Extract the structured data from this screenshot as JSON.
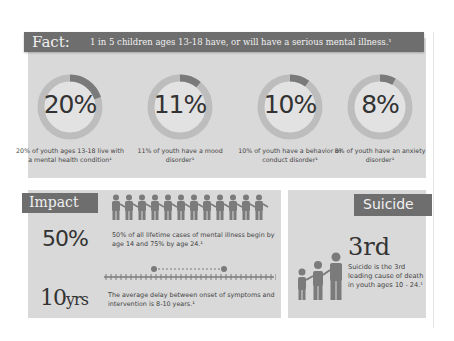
{
  "fact": {
    "label": "Fact:",
    "headline": "1 in 5 children ages 13-18 have, or will have a serious mental illness.¹",
    "stats": [
      {
        "value": 20,
        "label": "20%",
        "caption": "20% of youth ages 13-18 live with a mental health condition¹"
      },
      {
        "value": 11,
        "label": "11%",
        "caption": "11% of youth have a mood disorder¹"
      },
      {
        "value": 10,
        "label": "10%",
        "caption": "10% of youth have a behavior or conduct disorder¹"
      },
      {
        "value": 8,
        "label": "8%",
        "caption": "8% of youth have an anxiety disorder¹"
      }
    ]
  },
  "impact": {
    "label": "Impact",
    "people_count": 12,
    "stat1": {
      "value": "50%",
      "text": "50% of all lifetime cases of mental illness begin by age 14 and 75% by age 24.¹"
    },
    "stat2": {
      "value": "10",
      "unit": "yrs",
      "text": "The average delay between onset of symptoms and intervention is 8-10 years.¹"
    }
  },
  "suicide": {
    "label": "Suicide",
    "value": "3rd",
    "text": "Suicide is the 3rd leading cause of death in youth ages 10 - 24.¹"
  },
  "colors": {
    "panel": "#d9d9d9",
    "banner": "#6e6e6e",
    "ring_track": "#bdbdbd",
    "ring_fill": "#7a7a7a",
    "icon": "#7b7b7b"
  }
}
